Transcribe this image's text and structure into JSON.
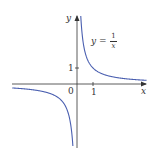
{
  "chart_data": {
    "type": "line",
    "title": "",
    "xlabel": "x",
    "ylabel": "y",
    "annotation": "y = 1/x",
    "function": "1/x",
    "series": [
      {
        "name": "y = 1/x",
        "color": "#4a5fb0",
        "x": [
          -4,
          -3,
          -2,
          -1,
          -0.5,
          -0.25,
          -0.15,
          0.15,
          0.25,
          0.5,
          1,
          2,
          3,
          4
        ],
        "y": [
          -0.25,
          -0.333,
          -0.5,
          -1,
          -2,
          -4,
          -6.67,
          6.67,
          4,
          2,
          1,
          0.5,
          0.333,
          0.25
        ]
      }
    ],
    "xticks": [
      {
        "value": 0,
        "label": "0"
      },
      {
        "value": 1,
        "label": "1"
      }
    ],
    "yticks": [
      {
        "value": 1,
        "label": "1"
      }
    ],
    "xlim": [
      -4.1,
      4.4
    ],
    "ylim": [
      -4.0,
      4.3
    ],
    "grid": false,
    "asymptotes": {
      "vertical": 0,
      "horizontal": 0
    }
  },
  "labels": {
    "x_axis": "x",
    "y_axis": "y",
    "origin": "0",
    "x_tick_1": "1",
    "y_tick_1": "1",
    "eq_lhs": "y =",
    "eq_num": "1",
    "eq_den": "x"
  },
  "colors": {
    "curve": "#4a5fb0",
    "axis": "#333333"
  }
}
